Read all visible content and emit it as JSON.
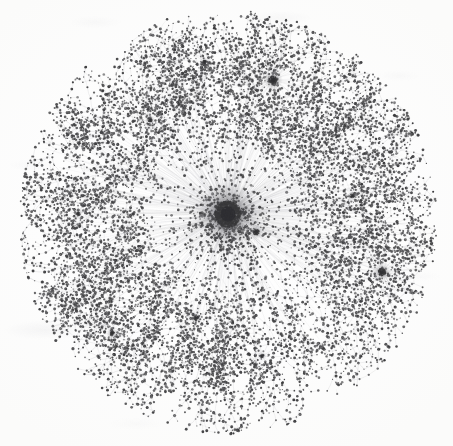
{
  "figure": {
    "title": "Scale-free network graph",
    "caption": "",
    "width_px": 453,
    "height_px": 446
  },
  "chart_data": {
    "type": "scatter",
    "subtype": "network-graph",
    "title": "",
    "subtitle": "",
    "xlabel": "",
    "ylabel": "",
    "xlim": [
      0,
      453
    ],
    "ylim": [
      0,
      446
    ],
    "grid": false,
    "legend": null,
    "legend_position": "none",
    "axes_visible": false,
    "tick_labels": {
      "x": [],
      "y": []
    },
    "annotations": [],
    "layout": "force-directed-radial",
    "background_color": "#fdfdfc",
    "node_color": "#3a3a3c",
    "edge_color": "#b9b9bd",
    "node_count_approx": 2400,
    "edge_count_approx": 2600,
    "node_radius_px": [
      0.6,
      1.6
    ],
    "edge_width_px": 0.35,
    "disc": {
      "cx": 228,
      "cy": 222,
      "rx": 203,
      "ry": 206
    },
    "hubs": [
      {
        "id": "primary-hub",
        "x": 228,
        "y": 214,
        "degree": 520,
        "core_radius_px": 10.5,
        "spoke_length_px": [
          18,
          150
        ],
        "darkness": 1.0
      },
      {
        "id": "hub-top-right",
        "x": 273,
        "y": 80,
        "degree": 46,
        "core_radius_px": 3.2,
        "spoke_length_px": [
          10,
          52
        ],
        "darkness": 0.85
      },
      {
        "id": "hub-bottom-right",
        "x": 382,
        "y": 272,
        "degree": 40,
        "core_radius_px": 3.0,
        "spoke_length_px": [
          10,
          48
        ],
        "darkness": 0.82
      },
      {
        "id": "hub-near-core",
        "x": 256,
        "y": 232,
        "degree": 22,
        "core_radius_px": 2.4,
        "spoke_length_px": [
          7,
          26
        ],
        "darkness": 0.8
      },
      {
        "id": "hub-lower-mid",
        "x": 196,
        "y": 318,
        "degree": 18,
        "core_radius_px": 1.9,
        "spoke_length_px": [
          8,
          34
        ],
        "darkness": 0.7
      },
      {
        "id": "hub-left-lower",
        "x": 112,
        "y": 333,
        "degree": 15,
        "core_radius_px": 1.8,
        "spoke_length_px": [
          8,
          30
        ],
        "darkness": 0.68
      },
      {
        "id": "hub-upper-left",
        "x": 150,
        "y": 120,
        "degree": 14,
        "core_radius_px": 1.7,
        "spoke_length_px": [
          8,
          30
        ],
        "darkness": 0.66
      },
      {
        "id": "hub-right-mid",
        "x": 352,
        "y": 196,
        "degree": 13,
        "core_radius_px": 1.6,
        "spoke_length_px": [
          8,
          28
        ],
        "darkness": 0.64
      },
      {
        "id": "hub-top-mid",
        "x": 205,
        "y": 62,
        "degree": 12,
        "core_radius_px": 1.6,
        "spoke_length_px": [
          8,
          28
        ],
        "darkness": 0.62
      },
      {
        "id": "hub-left-mid",
        "x": 78,
        "y": 214,
        "degree": 11,
        "core_radius_px": 1.5,
        "spoke_length_px": [
          8,
          26
        ],
        "darkness": 0.6
      },
      {
        "id": "hub-bottom-mid",
        "x": 262,
        "y": 356,
        "degree": 11,
        "core_radius_px": 1.5,
        "spoke_length_px": [
          8,
          26
        ],
        "darkness": 0.6
      }
    ],
    "degree_distribution_note": "heavy-tailed: one dominant hub, a handful of mid-degree hubs, long tail of degree-1 and degree-2 leaf nodes forming branching chains",
    "density_profile": [
      {
        "radius_px": 0,
        "relative_density": 1.0
      },
      {
        "radius_px": 12,
        "relative_density": 0.88
      },
      {
        "radius_px": 30,
        "relative_density": 0.52
      },
      {
        "radius_px": 60,
        "relative_density": 0.3
      },
      {
        "radius_px": 100,
        "relative_density": 0.18
      },
      {
        "radius_px": 150,
        "relative_density": 0.1
      },
      {
        "radius_px": 200,
        "relative_density": 0.03
      }
    ]
  },
  "render": {
    "seed": 20240917,
    "edge_opacity": 0.55,
    "node_opacity": 0.92
  }
}
